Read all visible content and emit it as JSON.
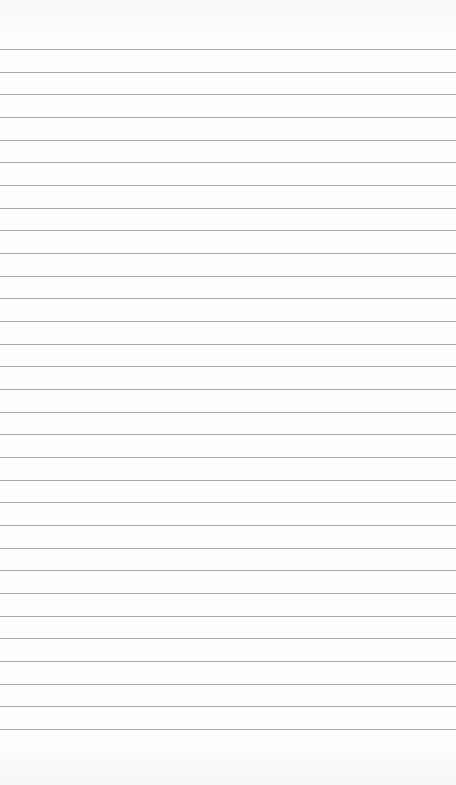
{
  "page": {
    "type": "blank lined paper",
    "rule_count": 31,
    "rule_color": "#a9a9a9",
    "background_color": "#fdfdfd"
  }
}
